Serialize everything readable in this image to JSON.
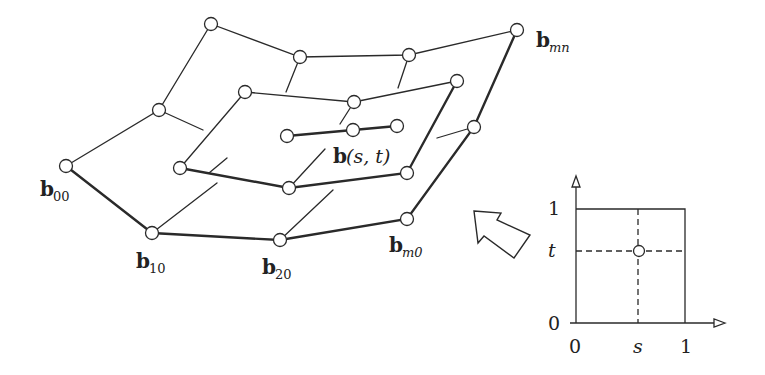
{
  "diagram": {
    "labels": {
      "b00": {
        "base": "b",
        "sub": "00"
      },
      "b10": {
        "base": "b",
        "sub": "10"
      },
      "b20": {
        "base": "b",
        "sub": "20"
      },
      "bm0": {
        "base": "b",
        "sub": "m0"
      },
      "bmn": {
        "base": "b",
        "sub": "mn"
      },
      "bst": {
        "base": "b",
        "args": "(s, t)"
      }
    },
    "parameter_domain": {
      "x_label": "s",
      "y_label": "t",
      "x_ticks": [
        "0",
        "s",
        "1"
      ],
      "y_ticks": [
        "0",
        "t",
        "1"
      ]
    },
    "colors": {
      "stroke": "#2a2a2a",
      "background": "#ffffff"
    }
  }
}
